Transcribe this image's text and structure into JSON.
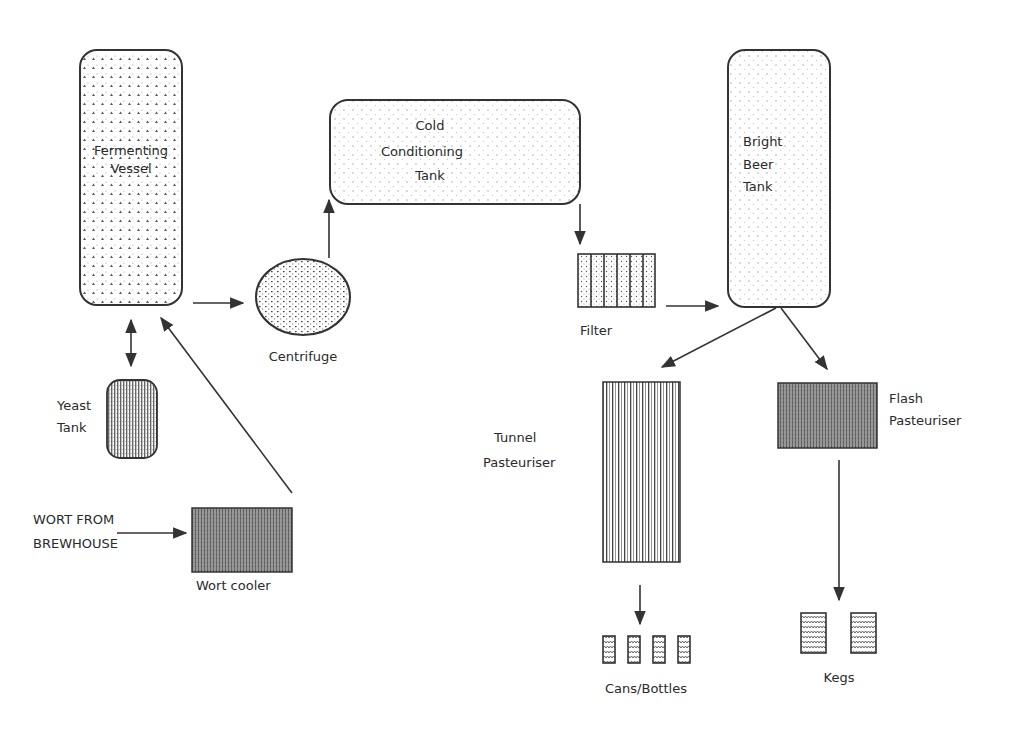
{
  "diagram": {
    "colors": {
      "stroke": "#333333",
      "background": "#ffffff",
      "dark_fill": "#4a4a4a"
    },
    "nodes": {
      "fermenting_vessel": {
        "label_1": "Fermenting",
        "label_2": "Vessel"
      },
      "cold_conditioning_tank": {
        "label_1": "Cold",
        "label_2": "Conditioning",
        "label_3": "Tank"
      },
      "bright_beer_tank": {
        "label_1": "Bright",
        "label_2": "Beer",
        "label_3": "Tank"
      },
      "centrifuge": {
        "label": "Centrifuge"
      },
      "yeast_tank": {
        "label_1": "Yeast",
        "label_2": "Tank"
      },
      "wort_cooler": {
        "label": "Wort cooler"
      },
      "wort_source": {
        "label_1": "WORT FROM",
        "label_2": "BREWHOUSE"
      },
      "filter": {
        "label": "Filter"
      },
      "tunnel_pasteuriser": {
        "label_1": "Tunnel",
        "label_2": "Pasteuriser"
      },
      "flash_pasteuriser": {
        "label_1": "Flash",
        "label_2": "Pasteuriser"
      },
      "cans_bottles": {
        "label": "Cans/Bottles",
        "count": 4
      },
      "kegs": {
        "label": "Kegs",
        "count": 2
      }
    },
    "edges": [
      {
        "from": "WORT FROM BREWHOUSE",
        "to": "Wort cooler"
      },
      {
        "from": "Wort cooler",
        "to": "Fermenting Vessel"
      },
      {
        "from": "Fermenting Vessel",
        "to": "Yeast Tank",
        "bidirectional": true
      },
      {
        "from": "Fermenting Vessel",
        "to": "Centrifuge"
      },
      {
        "from": "Centrifuge",
        "to": "Cold Conditioning Tank"
      },
      {
        "from": "Cold Conditioning Tank",
        "to": "Filter"
      },
      {
        "from": "Filter",
        "to": "Bright Beer Tank"
      },
      {
        "from": "Bright Beer Tank",
        "to": "Tunnel Pasteuriser"
      },
      {
        "from": "Bright Beer Tank",
        "to": "Flash Pasteuriser"
      },
      {
        "from": "Tunnel Pasteuriser",
        "to": "Cans/Bottles"
      },
      {
        "from": "Flash Pasteuriser",
        "to": "Kegs"
      }
    ]
  }
}
